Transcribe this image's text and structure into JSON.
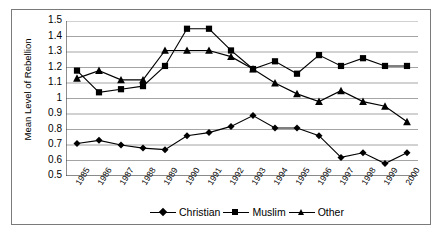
{
  "chart_data": {
    "type": "line",
    "title": "",
    "xlabel": "",
    "ylabel": "Mean Level of Rebellion",
    "ylim": [
      0.5,
      1.5
    ],
    "ytick_step": 0.1,
    "yticks": [
      "1.5",
      "1.4",
      "1.3",
      "1.2",
      "1.1",
      "1",
      "0.9",
      "0.8",
      "0.7",
      "0.6",
      "0.5"
    ],
    "grid": true,
    "legend_position": "bottom",
    "categories": [
      "1985",
      "1986",
      "1987",
      "1988",
      "1989",
      "1990",
      "1991",
      "1992",
      "1993",
      "1994",
      "1995",
      "1996",
      "1997",
      "1998",
      "1999",
      "2000"
    ],
    "series": [
      {
        "name": "Christian",
        "marker": "diamond",
        "color": "#000000",
        "values": [
          0.71,
          0.73,
          0.7,
          0.68,
          0.67,
          0.76,
          0.78,
          0.82,
          0.89,
          0.81,
          0.81,
          0.76,
          0.62,
          0.65,
          0.58,
          0.65
        ]
      },
      {
        "name": "Muslim",
        "marker": "square",
        "color": "#000000",
        "values": [
          1.18,
          1.04,
          1.06,
          1.08,
          1.21,
          1.45,
          1.45,
          1.31,
          1.19,
          1.24,
          1.16,
          1.28,
          1.21,
          1.26,
          1.21,
          1.21
        ]
      },
      {
        "name": "Other",
        "marker": "triangle",
        "color": "#000000",
        "values": [
          1.13,
          1.18,
          1.12,
          1.12,
          1.31,
          1.31,
          1.31,
          1.27,
          1.19,
          1.1,
          1.03,
          0.98,
          1.05,
          0.98,
          0.95,
          0.85
        ]
      }
    ]
  },
  "legend": {
    "items": [
      {
        "label": "Christian",
        "marker": "diamond"
      },
      {
        "label": "Muslim",
        "marker": "square"
      },
      {
        "label": "Other",
        "marker": "triangle"
      }
    ]
  },
  "axis": {
    "y_title": "Mean Level of Rebellion"
  }
}
